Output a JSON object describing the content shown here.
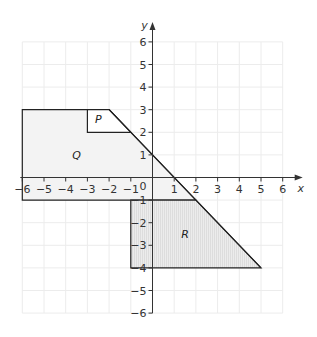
{
  "diagram": {
    "type": "coordinate-grid",
    "axes": {
      "x_label": "x",
      "y_label": "y",
      "origin_label": "0",
      "x_range": [
        -6,
        6
      ],
      "y_range": [
        -6,
        6
      ],
      "x_ticks": [
        "-6",
        "-5",
        "-4",
        "-3",
        "-2",
        "-1",
        "1",
        "2",
        "3",
        "4",
        "5",
        "6"
      ],
      "y_ticks": [
        "6",
        "5",
        "4",
        "3",
        "2",
        "1",
        "-1",
        "-2",
        "-3",
        "-4",
        "-5",
        "-6"
      ]
    },
    "shapes": [
      {
        "label": "Q",
        "vertices": [
          [
            -6,
            3
          ],
          [
            -2,
            3
          ],
          [
            2,
            -1
          ],
          [
            -6,
            -1
          ]
        ],
        "fill": "#f3f3f3"
      },
      {
        "label": "P",
        "vertices": [
          [
            -3,
            3
          ],
          [
            -2,
            3
          ],
          [
            -1,
            2
          ],
          [
            -3,
            2
          ]
        ],
        "fill": "#ffffff"
      },
      {
        "label": "R",
        "vertices": [
          [
            -1,
            -1
          ],
          [
            2,
            -1
          ],
          [
            5,
            -4
          ],
          [
            -1,
            -4
          ]
        ],
        "fill": "#e6e6e6"
      }
    ],
    "line": {
      "from": [
        -2,
        3
      ],
      "to": [
        5,
        -4
      ]
    },
    "colors": {
      "grid": "#ececec",
      "stroke": "#222222",
      "axis": "#333333"
    }
  }
}
